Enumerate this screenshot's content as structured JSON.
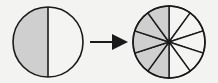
{
  "diagram": {
    "colors": {
      "background": "#f3f3f1",
      "stroke": "#1a1a1a",
      "shaded": "#cfcfcf",
      "unshaded": "#f4f4f2"
    },
    "left_circle": {
      "parts": 2,
      "shaded_parts": 1,
      "cx": 48,
      "cy": 42,
      "r": 35
    },
    "arrow": {
      "x1": 90,
      "x2": 127,
      "y": 42,
      "label": ""
    },
    "right_circle": {
      "parts": 10,
      "shaded_parts": 5,
      "cx": 169,
      "cy": 42,
      "r": 36
    }
  }
}
